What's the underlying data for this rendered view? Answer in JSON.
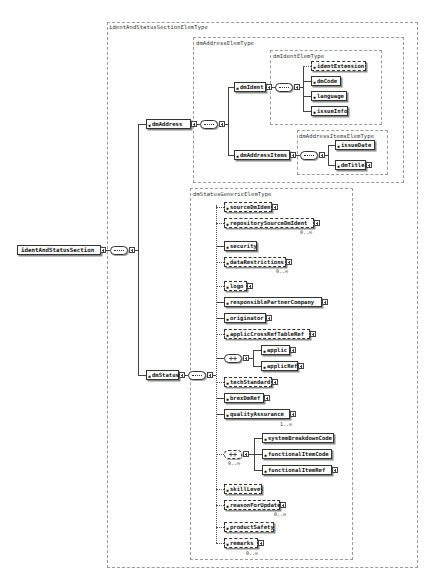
{
  "diagram": {
    "root": {
      "label": "identAndStatusSection"
    },
    "types": {
      "outer": "identAndStatusSectionElemType",
      "address": "dmAddressElemType",
      "ident": "dmIdentElemType",
      "addressItems": "dmAddressItemsElemType",
      "status": "dmStatusGenericElemType"
    },
    "address": {
      "label": "dmAddress"
    },
    "status": {
      "label": "dmStatus"
    },
    "ident": {
      "label": "dmIdent",
      "children": [
        {
          "label": "identExtension",
          "optional": true
        },
        {
          "label": "dmCode",
          "optional": false
        },
        {
          "label": "language",
          "optional": false
        },
        {
          "label": "issueInfo",
          "optional": false
        }
      ]
    },
    "addressItems": {
      "label": "dmAddressItems",
      "children": [
        {
          "label": "issueDate",
          "optional": false
        },
        {
          "label": "dmTitle",
          "optional": false
        }
      ]
    },
    "statusChildren": [
      {
        "label": "sourceDmIdent",
        "optional": true
      },
      {
        "label": "repositorySourceDmIdent",
        "optional": true,
        "cardinality": "0..∞"
      },
      {
        "label": "security",
        "optional": false
      },
      {
        "label": "dataRestrictions",
        "optional": true,
        "cardinality": "0..∞"
      },
      {
        "label": "logo",
        "optional": true
      },
      {
        "label": "responsiblePartnerCompany",
        "optional": false
      },
      {
        "label": "originator",
        "optional": false
      },
      {
        "label": "applicCrossRefTableRef",
        "optional": true
      },
      {
        "label": "applic",
        "optional": false
      },
      {
        "label": "applicRef",
        "optional": false
      },
      {
        "label": "techStandard",
        "optional": true
      },
      {
        "label": "brexDmRef",
        "optional": false
      },
      {
        "label": "qualityAssurance",
        "optional": false,
        "cardinality": "1..∞"
      },
      {
        "label": "systemBreakdownCode",
        "optional": false
      },
      {
        "label": "functionalItemCode",
        "optional": false
      },
      {
        "label": "functionalItemRef",
        "optional": false
      },
      {
        "label": "skillLevel",
        "optional": true
      },
      {
        "label": "reasonForUpdate",
        "optional": true,
        "cardinality": "0..∞"
      },
      {
        "label": "productSafety",
        "optional": true
      },
      {
        "label": "remarks",
        "optional": true,
        "cardinality": "0..∞"
      }
    ],
    "choiceCardinality": "0..∞"
  }
}
